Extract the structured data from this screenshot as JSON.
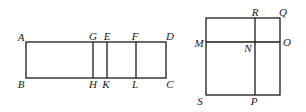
{
  "figure_left": {
    "name": "rectangle-ABCD",
    "rect": {
      "x1": 26,
      "y1": 42,
      "x2": 166,
      "y2": 78
    },
    "verticals": [
      {
        "name": "segment-GH",
        "x": 93
      },
      {
        "name": "segment-EK",
        "x": 107
      },
      {
        "name": "segment-FL",
        "x": 136
      }
    ],
    "labels": [
      {
        "id": "A",
        "text": "A",
        "x": 21,
        "y": 37
      },
      {
        "id": "B",
        "text": "B",
        "x": 21,
        "y": 84
      },
      {
        "id": "G",
        "text": "G",
        "x": 93,
        "y": 36
      },
      {
        "id": "E",
        "text": "E",
        "x": 107,
        "y": 36
      },
      {
        "id": "F",
        "text": "F",
        "x": 135,
        "y": 36
      },
      {
        "id": "D",
        "text": "D",
        "x": 170,
        "y": 36
      },
      {
        "id": "H",
        "text": "H",
        "x": 93,
        "y": 84
      },
      {
        "id": "K",
        "text": "K",
        "x": 106,
        "y": 84
      },
      {
        "id": "L",
        "text": "L",
        "x": 135,
        "y": 84
      },
      {
        "id": "C",
        "text": "C",
        "x": 170,
        "y": 84
      }
    ]
  },
  "figure_right": {
    "name": "square-QOPS",
    "rect": {
      "x1": 206,
      "y1": 18,
      "x2": 280,
      "y2": 95
    },
    "horizontal": {
      "name": "segment-MO",
      "y": 42
    },
    "vertical": {
      "name": "segment-RP",
      "x": 255
    },
    "labels": [
      {
        "id": "R",
        "text": "R",
        "x": 255,
        "y": 12
      },
      {
        "id": "Q",
        "text": "Q",
        "x": 283,
        "y": 12
      },
      {
        "id": "M",
        "text": "M",
        "x": 199,
        "y": 43
      },
      {
        "id": "N",
        "text": "N",
        "x": 248,
        "y": 48
      },
      {
        "id": "O",
        "text": "O",
        "x": 287,
        "y": 42
      },
      {
        "id": "S",
        "text": "S",
        "x": 200,
        "y": 101
      },
      {
        "id": "P",
        "text": "P",
        "x": 254,
        "y": 101
      }
    ]
  },
  "style": {
    "stroke": "#1a1a1a",
    "stroke_width": 1.3
  }
}
